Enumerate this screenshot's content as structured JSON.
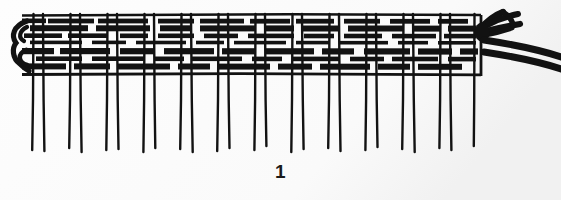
{
  "figure": {
    "caption": "1",
    "title": "Woven band construction diagram",
    "colors": {
      "background": "#fbfbfb",
      "ink": "#121212",
      "paper_shade": "#f2f2f2"
    },
    "canvas": {
      "width": 561,
      "height": 200
    }
  },
  "weave": {
    "area": {
      "left": 22,
      "right": 481,
      "top": 14,
      "bottom": 78
    },
    "top_edge_label": "top selvedge line",
    "bottom_edge_label": "fell line",
    "warp": {
      "count_pairs": 11,
      "count_threads": 22,
      "pair_gap": 9,
      "pair_centers": [
        38,
        75,
        112,
        149,
        186,
        223,
        260,
        297,
        334,
        371,
        408
      ],
      "hang_bottom": 152,
      "stroke_width": 2.4
    },
    "weft": {
      "row_count": 8,
      "rows": [
        {
          "y": 19,
          "thickness": 5,
          "label": "weft-row-1"
        },
        {
          "y": 27,
          "thickness": 6,
          "label": "weft-row-2"
        },
        {
          "y": 35,
          "thickness": 5,
          "label": "weft-row-3"
        },
        {
          "y": 43,
          "thickness": 4,
          "label": "weft-row-4"
        },
        {
          "y": 51,
          "thickness": 6,
          "label": "weft-row-5"
        },
        {
          "y": 59,
          "thickness": 5,
          "label": "weft-row-6"
        },
        {
          "y": 66,
          "thickness": 6,
          "label": "weft-row-7"
        },
        {
          "y": 73,
          "thickness": 4,
          "label": "weft-row-8"
        }
      ],
      "float_pattern": "alternating over/under warp pairs"
    },
    "selvedge_left": {
      "label": "left turning loop",
      "x": 22,
      "top": 22,
      "bottom": 72
    },
    "exit_right": {
      "label": "working weft ends",
      "strand_count": 2,
      "knot_label": "crossing fork",
      "origin_x": 481,
      "origin_y": 30,
      "end_x": 561,
      "strand_thickness": 7
    }
  }
}
